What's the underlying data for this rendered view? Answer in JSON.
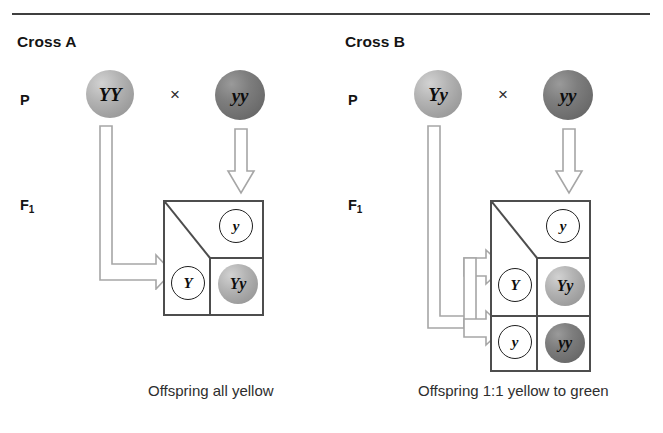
{
  "figure": {
    "divider": "top-horizontal-rule"
  },
  "crosses": [
    {
      "id": "cross-a",
      "title": "Cross A",
      "generation_labels": {
        "parental": "P",
        "filial": "F",
        "filial_subscript": "1"
      },
      "parents": [
        {
          "genotype": "YY",
          "shade": "light",
          "phenotype": "yellow"
        },
        {
          "genotype": "yy",
          "shade": "dark",
          "phenotype": "green"
        }
      ],
      "cross_symbol": "×",
      "punnett": {
        "rows": 1,
        "cols": 1,
        "top_gametes": [
          "y"
        ],
        "side_gametes": [
          "Y"
        ],
        "offspring": [
          {
            "genotype": "Yy",
            "shade": "light",
            "phenotype": "yellow"
          }
        ]
      },
      "caption": "Offspring all yellow"
    },
    {
      "id": "cross-b",
      "title": "Cross B",
      "generation_labels": {
        "parental": "P",
        "filial": "F",
        "filial_subscript": "1"
      },
      "parents": [
        {
          "genotype": "Yy",
          "shade": "light",
          "phenotype": "yellow"
        },
        {
          "genotype": "yy",
          "shade": "dark",
          "phenotype": "green"
        }
      ],
      "cross_symbol": "×",
      "punnett": {
        "rows": 2,
        "cols": 1,
        "top_gametes": [
          "y"
        ],
        "side_gametes": [
          "Y",
          "y"
        ],
        "offspring": [
          {
            "genotype": "Yy",
            "shade": "light",
            "phenotype": "yellow"
          },
          {
            "genotype": "yy",
            "shade": "dark",
            "phenotype": "green"
          }
        ]
      },
      "caption": "Offspring 1:1 yellow to green"
    }
  ],
  "colors": {
    "pea_light": "#a8a8a8",
    "pea_dark": "#767676",
    "grid_line": "#4d4d4d",
    "arrow_outline": "#a6a6a6",
    "rule": "#3f3f3f",
    "text": "#1a1a1a"
  }
}
